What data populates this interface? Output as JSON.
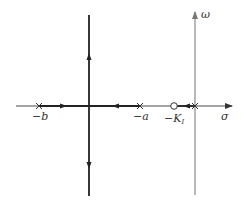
{
  "diagram": {
    "type": "root-locus",
    "axes": {
      "real_axis_label": "σ",
      "imag_axis_label": "ω"
    },
    "points": [
      {
        "kind": "pole",
        "symbol": "×",
        "label": "−b"
      },
      {
        "kind": "pole",
        "symbol": "×",
        "label": "−a"
      },
      {
        "kind": "zero",
        "symbol": "○",
        "label_main": "−K",
        "label_sub": "I"
      },
      {
        "kind": "pole",
        "symbol": "×",
        "label": ""
      }
    ],
    "branches": [
      {
        "from": "−b",
        "direction": "right",
        "toward": "breakaway"
      },
      {
        "from": "−a",
        "direction": "left",
        "toward": "breakaway"
      },
      {
        "from": "breakaway",
        "direction": "up",
        "toward": "+j∞"
      },
      {
        "from": "breakaway",
        "direction": "down",
        "toward": "−j∞"
      },
      {
        "from": "origin",
        "direction": "left",
        "toward": "−K_I"
      }
    ],
    "colors": {
      "locus": "#222222",
      "real_axis": "#333333",
      "imag_axis": "#9a9a9a",
      "background": "#ffffff"
    }
  }
}
